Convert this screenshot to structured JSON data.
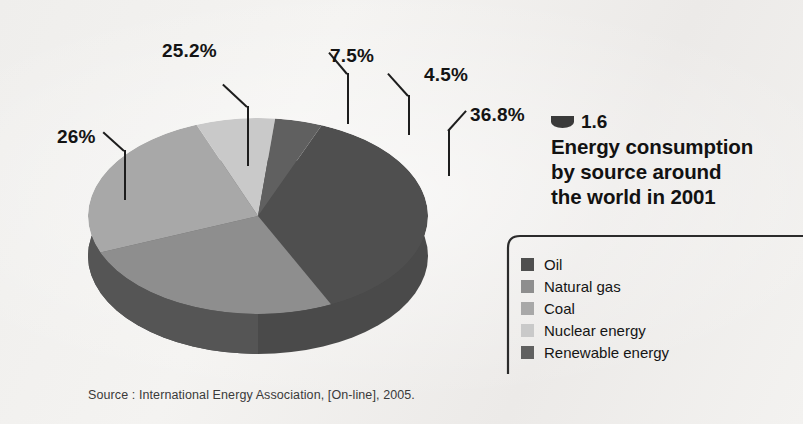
{
  "figure": {
    "marker_icon": "half-circle-icon",
    "number": "1.6",
    "title": "Energy consumption by source around the world in 2001",
    "title_lines": [
      "Energy consumption",
      "by source around",
      "the world in 2001"
    ],
    "source": "Source : International Energy Association, [On-line], 2005."
  },
  "colors": {
    "background": "#f2f1ef",
    "text": "#141414",
    "leader_line": "#1d1d1d",
    "bracket": "#2b2b2b",
    "oil": "#4f4f4f",
    "natural_gas": "#8e8e8e",
    "coal": "#a8a8a8",
    "nuclear_energy": "#c9c9c9",
    "renewable_energy": "#606060",
    "pie_side_dark": "#3f3f3f",
    "pie_side_mid": "#555555"
  },
  "legend": {
    "items": [
      {
        "label": "Oil",
        "color": "#4f4f4f"
      },
      {
        "label": "Natural gas",
        "color": "#8e8e8e"
      },
      {
        "label": "Coal",
        "color": "#a8a8a8"
      },
      {
        "label": "Nuclear energy",
        "color": "#c9c9c9"
      },
      {
        "label": "Renewable energy",
        "color": "#606060"
      }
    ]
  },
  "labels": {
    "coal": "25.2%",
    "nuclear": "7.5%",
    "renewable": "4.5%",
    "oil": "36.8%",
    "natural_gas": "26%"
  },
  "chart_data": {
    "type": "pie",
    "title": "Energy consumption by source around the world in 2001",
    "subtitle": "",
    "xlabel": "",
    "ylabel": "",
    "unit": "%",
    "legend_position": "right",
    "grid": false,
    "three_d": true,
    "categories": [
      "Oil",
      "Natural gas",
      "Coal",
      "Nuclear energy",
      "Renewable energy"
    ],
    "values": [
      36.8,
      26,
      25.2,
      7.5,
      4.5
    ],
    "data_labels": [
      "36.8%",
      "26%",
      "25.2%",
      "7.5%",
      "4.5%"
    ],
    "colors": [
      "#4f4f4f",
      "#8e8e8e",
      "#a8a8a8",
      "#c9c9c9",
      "#606060"
    ],
    "source": "Source : International Energy Association, [On-line], 2005."
  }
}
